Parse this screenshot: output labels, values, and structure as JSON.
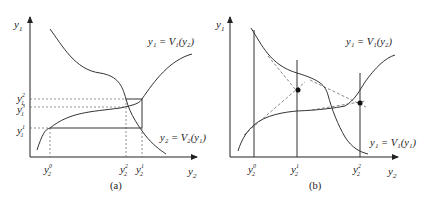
{
  "panel_a": {
    "caption": "(a)",
    "y_axis_label": "y",
    "y_axis_sub": "1",
    "x_axis_label": "y",
    "x_axis_sub": "2",
    "curve_v1_label": "y₁ = V₁(y₂)",
    "curve_v2_label": "y₂ = V₂(y₁)",
    "y_ticks": [
      {
        "base": "y",
        "sub": "1",
        "sup": "2"
      },
      {
        "base": "y",
        "sub": "1",
        "sup": "3"
      },
      {
        "base": "y",
        "sub": "1",
        "sup": "1"
      }
    ],
    "x_ticks": [
      {
        "base": "y",
        "sub": "2",
        "sup": "0"
      },
      {
        "base": "y",
        "sub": "2",
        "sup": "2"
      },
      {
        "base": "y",
        "sub": "2",
        "sup": "1"
      }
    ]
  },
  "panel_b": {
    "caption": "(b)",
    "y_axis_label": "y",
    "y_axis_sub": "1",
    "x_axis_label": "y",
    "x_axis_sub": "2",
    "curve_top_label": "y₁ = V₁(y₂)",
    "curve_bottom_label": "y₁ = V₁(y₁)",
    "x_ticks": [
      {
        "base": "y",
        "sub": "2",
        "sup": "0"
      },
      {
        "base": "y",
        "sub": "2",
        "sup": "1"
      },
      {
        "base": "y",
        "sub": "2",
        "sup": "2"
      }
    ]
  },
  "colors": {
    "line": "#333333",
    "dash": "#555555",
    "text": "#222222"
  }
}
